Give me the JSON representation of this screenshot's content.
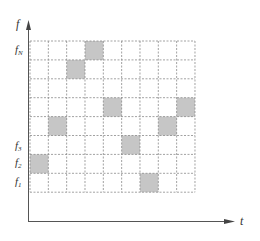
{
  "axes": {
    "y_label": "f",
    "x_label": "t"
  },
  "grid": {
    "rows": 8,
    "cols": 9,
    "x0": 30,
    "y0": 41,
    "cell_w": 18.33,
    "cell_h": 18.9,
    "line_color": "#8a8a8a",
    "fill_color": "#c6c6c6"
  },
  "shaded_cells": [
    {
      "row": 0,
      "col": 3
    },
    {
      "row": 1,
      "col": 2
    },
    {
      "row": 3,
      "col": 4
    },
    {
      "row": 3,
      "col": 8
    },
    {
      "row": 4,
      "col": 1
    },
    {
      "row": 4,
      "col": 7
    },
    {
      "row": 5,
      "col": 5
    },
    {
      "row": 6,
      "col": 0
    },
    {
      "row": 7,
      "col": 6
    }
  ],
  "row_labels": [
    {
      "base": "f",
      "sub": "N",
      "y": 53
    },
    {
      "base": "f",
      "sub": "3",
      "y": 149
    },
    {
      "base": "f",
      "sub": "2",
      "y": 166
    },
    {
      "base": "f",
      "sub": "1",
      "y": 185
    }
  ]
}
